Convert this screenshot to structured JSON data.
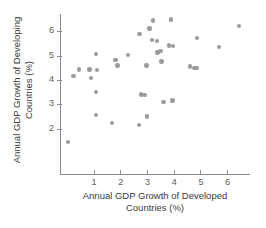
{
  "chart_data": {
    "type": "scatter",
    "title": "",
    "xlabel": "Annual GDP Growth of Developed Countries (%)",
    "ylabel": "Annual GDP Growth of Developing Countries (%)",
    "xlabel_line1": "Annual GDP Growth of Developed",
    "xlabel_line2": "Countries (%)",
    "ylabel_line1": "Annual GDP Growth of Developing",
    "ylabel_line2": "Countries (%)",
    "xlim": [
      0.0,
      6.9
    ],
    "ylim": [
      1.2,
      6.8
    ],
    "xticks": [
      1,
      2,
      3,
      4,
      5,
      6
    ],
    "yticks": [
      2,
      3,
      4,
      5,
      6
    ],
    "xtick_labels": [
      "1",
      "2",
      "3",
      "4",
      "5",
      "6"
    ],
    "ytick_labels": [
      "2",
      "3",
      "4",
      "5",
      "6"
    ],
    "grid": false,
    "legend": false,
    "marker_color": "#9b9b9b",
    "axis_color": "#8a8a8a",
    "points": [
      {
        "x": 0.05,
        "y": 1.45
      },
      {
        "x": 0.25,
        "y": 4.17
      },
      {
        "x": 0.45,
        "y": 4.42
      },
      {
        "x": 0.9,
        "y": 4.08
      },
      {
        "x": 0.85,
        "y": 4.42
      },
      {
        "x": 1.1,
        "y": 5.07
      },
      {
        "x": 1.12,
        "y": 4.4
      },
      {
        "x": 1.1,
        "y": 3.5
      },
      {
        "x": 1.08,
        "y": 2.56
      },
      {
        "x": 1.7,
        "y": 2.22
      },
      {
        "x": 1.82,
        "y": 4.82
      },
      {
        "x": 1.9,
        "y": 4.6
      },
      {
        "x": 2.28,
        "y": 5.03
      },
      {
        "x": 2.72,
        "y": 5.9
      },
      {
        "x": 2.7,
        "y": 2.15
      },
      {
        "x": 2.78,
        "y": 3.4
      },
      {
        "x": 2.9,
        "y": 3.38
      },
      {
        "x": 3.0,
        "y": 2.5
      },
      {
        "x": 2.98,
        "y": 4.6
      },
      {
        "x": 3.1,
        "y": 6.12
      },
      {
        "x": 3.18,
        "y": 5.63
      },
      {
        "x": 3.22,
        "y": 6.45
      },
      {
        "x": 3.38,
        "y": 5.6
      },
      {
        "x": 3.4,
        "y": 5.12
      },
      {
        "x": 3.5,
        "y": 5.18
      },
      {
        "x": 3.55,
        "y": 4.75
      },
      {
        "x": 3.62,
        "y": 3.1
      },
      {
        "x": 3.9,
        "y": 6.48
      },
      {
        "x": 3.82,
        "y": 5.42
      },
      {
        "x": 3.98,
        "y": 5.4
      },
      {
        "x": 3.95,
        "y": 3.15
      },
      {
        "x": 4.62,
        "y": 4.55
      },
      {
        "x": 4.75,
        "y": 4.48
      },
      {
        "x": 4.85,
        "y": 4.5
      },
      {
        "x": 4.88,
        "y": 5.72
      },
      {
        "x": 5.7,
        "y": 5.35
      },
      {
        "x": 6.45,
        "y": 6.22
      }
    ]
  }
}
